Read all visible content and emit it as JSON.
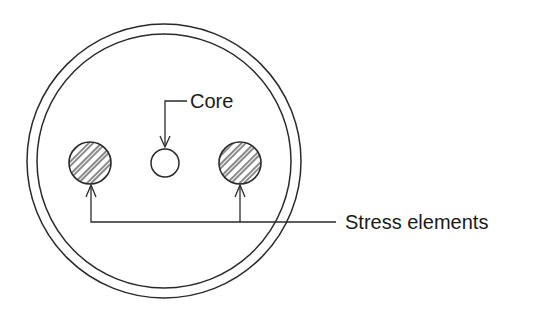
{
  "diagram": {
    "type": "cable-cross-section",
    "colors": {
      "line": "#2a2a2a",
      "text": "#1a1a1a",
      "background": "#ffffff"
    },
    "outer_jacket": {
      "cx": 164,
      "cy": 161,
      "r_outer": 137,
      "r_inner": 127
    },
    "core": {
      "cx": 165,
      "cy": 163,
      "r": 14
    },
    "stress_elements": [
      {
        "cx": 90,
        "cy": 163,
        "r": 21,
        "hatched": true
      },
      {
        "cx": 240,
        "cy": 163,
        "r": 21,
        "hatched": true
      }
    ],
    "labels": {
      "core": "Core",
      "stress_elements": "Stress elements"
    }
  }
}
